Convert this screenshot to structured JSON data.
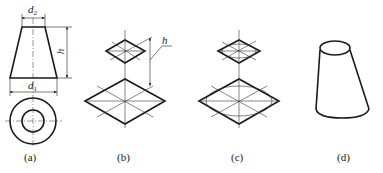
{
  "figure": {
    "panels": [
      {
        "id": "a",
        "caption": "(a)",
        "description": "Orthographic views of truncated cone (front and top)"
      },
      {
        "id": "b",
        "caption": "(b)",
        "description": "Isometric rhombuses for top and bottom circles separated by h"
      },
      {
        "id": "c",
        "caption": "(c)",
        "description": "Ellipses inscribed in isometric rhombuses"
      },
      {
        "id": "d",
        "caption": "(d)",
        "description": "Completed isometric drawing of truncated cone"
      }
    ],
    "dimensions": {
      "top_diameter": {
        "symbol": "d",
        "subscript": "2"
      },
      "bottom_diameter": {
        "symbol": "d",
        "subscript": "1"
      },
      "height": {
        "symbol": "h"
      },
      "height_b": {
        "symbol": "h"
      }
    },
    "colors": {
      "line": "#1a1a1a",
      "background": "#ffffff"
    }
  }
}
